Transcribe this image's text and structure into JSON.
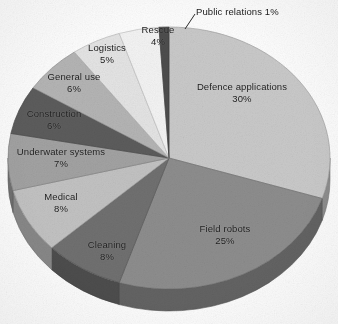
{
  "chart_data": {
    "type": "pie",
    "title": "",
    "subtitle": "",
    "xlabel": "",
    "ylabel": "",
    "legend_position": "none",
    "labels_on_slices": true,
    "three_d": true,
    "total_percent": 100,
    "categories": [
      "Defence applications",
      "Field robots",
      "Cleaning",
      "Medical",
      "Underwater systems",
      "Construction",
      "General use",
      "Logistics",
      "Rescue",
      "Public relations"
    ],
    "values": [
      30,
      25,
      8,
      8,
      7,
      6,
      6,
      5,
      4,
      1
    ],
    "value_labels": [
      "30%",
      "25%",
      "8%",
      "8%",
      "7%",
      "6%",
      "6%",
      "5%",
      "4%",
      "1%"
    ],
    "colors": [
      "#c9c9c9",
      "#8d8d8d",
      "#6f6f6f",
      "#c2c2c2",
      "#a2a2a2",
      "#5c5c5c",
      "#b4b4b4",
      "#e4e4e4",
      "#f3f3f3",
      "#4e4e4e"
    ],
    "slices": [
      {
        "label": "Defence applications",
        "percent_text": "30%",
        "value": 30,
        "color": "#c9c9c9"
      },
      {
        "label": "Field robots",
        "percent_text": "25%",
        "value": 25,
        "color": "#8d8d8d"
      },
      {
        "label": "Cleaning",
        "percent_text": "8%",
        "value": 8,
        "color": "#6f6f6f"
      },
      {
        "label": "Medical",
        "percent_text": "8%",
        "value": 8,
        "color": "#c2c2c2"
      },
      {
        "label": "Underwater systems",
        "percent_text": "7%",
        "value": 7,
        "color": "#a2a2a2"
      },
      {
        "label": "Construction",
        "percent_text": "6%",
        "value": 6,
        "color": "#5c5c5c"
      },
      {
        "label": "General use",
        "percent_text": "6%",
        "value": 6,
        "color": "#b4b4b4"
      },
      {
        "label": "Logistics",
        "percent_text": "5%",
        "value": 5,
        "color": "#e4e4e4"
      },
      {
        "label": "Rescue",
        "percent_text": "4%",
        "value": 4,
        "color": "#f3f3f3"
      },
      {
        "label": "Public relations",
        "percent_text": "1%",
        "value": 1,
        "color": "#4e4e4e"
      }
    ]
  },
  "labels": {
    "defence_applications": {
      "category": "Defence applications",
      "percent": "30%"
    },
    "field_robots": {
      "category": "Field robots",
      "percent": "25%"
    },
    "cleaning": {
      "category": "Cleaning",
      "percent": "8%"
    },
    "medical": {
      "category": "Medical",
      "percent": "8%"
    },
    "underwater_systems": {
      "category": "Underwater systems",
      "percent": "7%"
    },
    "construction": {
      "category": "Construction",
      "percent": "6%"
    },
    "general_use": {
      "category": "General use",
      "percent": "6%"
    },
    "logistics": {
      "category": "Logistics",
      "percent": "5%"
    },
    "rescue": {
      "category": "Rescue",
      "percent": "4%"
    },
    "public_relations": {
      "category": "Public relations",
      "percent": "1%"
    }
  }
}
